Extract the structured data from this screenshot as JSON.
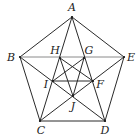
{
  "diagram": {
    "points": [
      {
        "id": "A",
        "label": "A"
      },
      {
        "id": "B",
        "label": "B"
      },
      {
        "id": "C",
        "label": "C"
      },
      {
        "id": "D",
        "label": "D"
      },
      {
        "id": "E",
        "label": "E"
      },
      {
        "id": "F",
        "label": "F"
      },
      {
        "id": "G",
        "label": "G"
      },
      {
        "id": "H",
        "label": "H"
      },
      {
        "id": "I",
        "label": "I"
      },
      {
        "id": "J",
        "label": "J"
      }
    ],
    "segments": [
      {
        "from": "A",
        "to": "B"
      },
      {
        "from": "B",
        "to": "C"
      },
      {
        "from": "C",
        "to": "D"
      },
      {
        "from": "D",
        "to": "E"
      },
      {
        "from": "E",
        "to": "A"
      },
      {
        "from": "B",
        "to": "E",
        "style": "light"
      },
      {
        "from": "A",
        "to": "C"
      },
      {
        "from": "A",
        "to": "D"
      },
      {
        "from": "B",
        "to": "D"
      },
      {
        "from": "E",
        "to": "C"
      },
      {
        "from": "I",
        "to": "F"
      },
      {
        "from": "H",
        "to": "F"
      },
      {
        "from": "H",
        "to": "J"
      },
      {
        "from": "G",
        "to": "I"
      },
      {
        "from": "G",
        "to": "J"
      }
    ],
    "colors": {
      "line": "#2a2a2a",
      "light_line": "#8a8a8a",
      "label": "#222222"
    }
  }
}
